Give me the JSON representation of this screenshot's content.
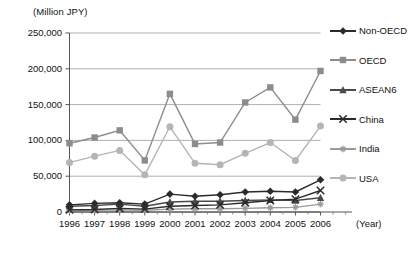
{
  "chart_data": {
    "type": "line",
    "title": "",
    "ylabel": "(Million JPY)",
    "xlabel": "(Year)",
    "ylim": [
      0,
      250000
    ],
    "ytick_labels": [
      "250,000",
      "200,000",
      "150,000",
      "100,000",
      "50,000",
      "0"
    ],
    "ytick_values": [
      250000,
      200000,
      150000,
      100000,
      50000,
      0
    ],
    "grid": true,
    "legend_position": "right",
    "categories": [
      "1996",
      "1997",
      "1998",
      "1999",
      "2000",
      "2001",
      "2002",
      "2003",
      "2004",
      "2005",
      "2006"
    ],
    "series": [
      {
        "name": "Non-OECD",
        "marker": "diamond",
        "color": "#2b2b2b",
        "values": [
          10000,
          12000,
          13000,
          11000,
          25000,
          22000,
          24000,
          28000,
          29000,
          28000,
          45000
        ]
      },
      {
        "name": "OECD",
        "marker": "square",
        "color": "#8c8c8c",
        "values": [
          96000,
          104000,
          114000,
          72000,
          165000,
          95000,
          97000,
          153000,
          174000,
          129000,
          197000
        ]
      },
      {
        "name": "ASEAN6",
        "marker": "triangle",
        "color": "#4a4a4a",
        "values": [
          8000,
          9000,
          11000,
          8000,
          14000,
          15000,
          15000,
          16000,
          17000,
          16000,
          20000
        ]
      },
      {
        "name": "China",
        "marker": "cross",
        "color": "#2b2b2b",
        "values": [
          3000,
          3500,
          5000,
          4000,
          8000,
          9000,
          10000,
          13000,
          16000,
          18000,
          30000
        ]
      },
      {
        "name": "India",
        "marker": "asterisk",
        "color": "#9a9a9a",
        "values": [
          2000,
          2500,
          3000,
          2500,
          4000,
          4500,
          4500,
          5000,
          6000,
          6500,
          11000
        ]
      },
      {
        "name": "USA",
        "marker": "circle",
        "color": "#b5b5b5",
        "values": [
          69000,
          78000,
          86000,
          52000,
          119000,
          68000,
          66000,
          82000,
          97000,
          72000,
          120000
        ]
      }
    ]
  },
  "axes": {
    "unit_label": "(Million JPY)",
    "year_label": "(Year)"
  }
}
